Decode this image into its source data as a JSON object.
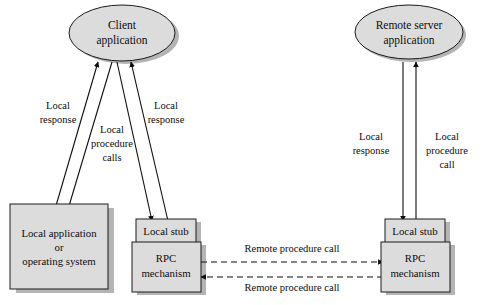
{
  "diagram": {
    "colors": {
      "shape_fill": "#dcdcdc",
      "shape_stroke": "#1a1a1a",
      "shadow": "#b4b4b4",
      "background": "#ffffff",
      "text": "#0d0d0d"
    },
    "nodes": {
      "client_application": {
        "shape": "ellipse",
        "line1": "Client",
        "line2": "application"
      },
      "remote_server_application": {
        "shape": "ellipse",
        "line1": "Remote server",
        "line2": "application"
      },
      "local_application_os": {
        "shape": "rectangle",
        "line1": "Local application",
        "line2": "or",
        "line3": "operating system"
      },
      "client_local_stub": {
        "shape": "rectangle",
        "line1": "Local stub"
      },
      "client_rpc_mechanism": {
        "shape": "rectangle",
        "line1": "RPC",
        "line2": "mechanism"
      },
      "server_local_stub": {
        "shape": "rectangle",
        "line1": "Local stub"
      },
      "server_rpc_mechanism": {
        "shape": "rectangle",
        "line1": "RPC",
        "line2": "mechanism"
      }
    },
    "edge_labels": {
      "client_os_response": {
        "line1": "Local",
        "line2": "response"
      },
      "client_os_calls": {
        "line1": "Local",
        "line2": "procedure",
        "line3": "calls"
      },
      "client_stub_response": {
        "line1": "Local",
        "line2": "response"
      },
      "server_response": {
        "line1": "Local",
        "line2": "response"
      },
      "server_call": {
        "line1": "Local",
        "line2": "procedure",
        "line3": "call"
      },
      "remote_call_outbound": "Remote procedure call",
      "remote_call_inbound": "Remote procedure call"
    }
  }
}
